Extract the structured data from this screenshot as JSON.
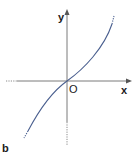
{
  "diagram": {
    "panel_label": "b",
    "axes": {
      "x_label": "x",
      "y_label": "y",
      "origin_label": "O"
    },
    "curve": {
      "description": "increasing curve through origin, concave down for x<0 and concave up for x>0 (cubic-like)",
      "color": "#4a5f8f",
      "dotted_ends": true
    },
    "colors": {
      "axis": "#7a7a7a",
      "curve": "#4a5f8f",
      "text": "#1a1a1a"
    }
  }
}
